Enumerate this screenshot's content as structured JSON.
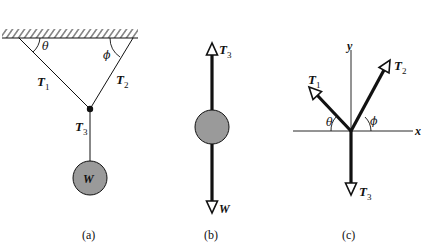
{
  "figure": {
    "panels": [
      {
        "id": "a",
        "caption": "(a)",
        "labels": {
          "angle_left": "θ",
          "angle_right": "ϕ",
          "tension1": "T",
          "tension1_sub": "1",
          "tension2": "T",
          "tension2_sub": "2",
          "tension3": "T",
          "tension3_sub": "3",
          "weight": "W"
        }
      },
      {
        "id": "b",
        "caption": "(b)",
        "labels": {
          "tension3": "T",
          "tension3_sub": "3",
          "weight": "W"
        }
      },
      {
        "id": "c",
        "caption": "(c)",
        "labels": {
          "y_axis": "y",
          "x_axis": "x",
          "angle_left": "θ",
          "angle_right": "ϕ",
          "tension1": "T",
          "tension1_sub": "1",
          "tension2": "T",
          "tension2_sub": "2",
          "tension3": "T",
          "tension3_sub": "3"
        }
      }
    ],
    "colors": {
      "ink": "#111111",
      "weight_fill": "#9a9a9a"
    }
  }
}
